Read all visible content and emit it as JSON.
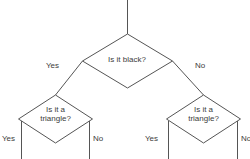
{
  "diagram": {
    "type": "decision-tree-flowchart",
    "stroke_color": "#555555",
    "text_color": "#3c3c3c",
    "background_color": "#ffffff",
    "root_inflow_label": "",
    "nodes": [
      {
        "id": "root",
        "shape": "diamond",
        "text_line1": "Is it black?",
        "text_line2": "",
        "cx": 127,
        "cy": 61,
        "rx": 45,
        "ry": 27
      },
      {
        "id": "left-branch",
        "shape": "diamond",
        "text_line1": "Is it a",
        "text_line2": "triangle?",
        "cx": 55,
        "cy": 119,
        "rx": 37,
        "ry": 24
      },
      {
        "id": "right-branch",
        "shape": "diamond",
        "text_line1": "Is it a",
        "text_line2": "triangle?",
        "cx": 203,
        "cy": 119,
        "rx": 37,
        "ry": 24
      }
    ],
    "edge_labels": [
      {
        "id": "root-yes",
        "text": "Yes",
        "x": 46,
        "y": 61
      },
      {
        "id": "root-no",
        "text": "No",
        "x": 195,
        "y": 61
      },
      {
        "id": "left-yes",
        "text": "Yes",
        "x": 2,
        "y": 134
      },
      {
        "id": "left-no",
        "text": "No",
        "x": 93,
        "y": 134
      },
      {
        "id": "right-yes",
        "text": "Yes",
        "x": 145,
        "y": 134
      },
      {
        "id": "right-no",
        "text": "No",
        "x": 241,
        "y": 134
      }
    ]
  }
}
